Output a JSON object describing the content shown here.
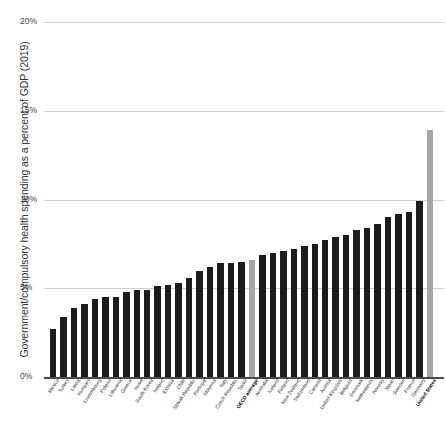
{
  "chart_data": {
    "type": "bar",
    "title": "",
    "xlabel": "",
    "ylabel": "Government/compulsory health spending as a percent of GDP (2019)",
    "ylim": [
      0,
      20
    ],
    "ytick_labels": [
      "0%",
      "5%",
      "10%",
      "15%",
      "20%"
    ],
    "ytick_values": [
      0,
      5,
      10,
      15,
      20
    ],
    "grid": true,
    "legend": "none",
    "categories": [
      "Mexico",
      "Turkey",
      "Latvia",
      "Hungary",
      "Luxembourg",
      "Poland",
      "Lithuania",
      "Greece",
      "Israel",
      "South Korea",
      "Ireland",
      "Estonia",
      "Chile",
      "Slovak Republic",
      "Portugal",
      "Slovenia",
      "Italy",
      "Czech Republic",
      "Spain",
      "OECD average",
      "Australia",
      "Iceland",
      "Finland",
      "New Zealand",
      "Switzerland",
      "Canada",
      "Austria",
      "United Kingdom",
      "Belgium",
      "Denmark",
      "Netherlands",
      "Norway",
      "Japan",
      "Sweden",
      "France",
      "Germany",
      "United States"
    ],
    "values": [
      2.7,
      3.4,
      3.9,
      4.1,
      4.4,
      4.5,
      4.5,
      4.8,
      4.9,
      4.9,
      5.1,
      5.2,
      5.3,
      5.6,
      6.0,
      6.2,
      6.4,
      6.4,
      6.5,
      6.6,
      6.9,
      7.0,
      7.1,
      7.2,
      7.4,
      7.5,
      7.7,
      7.9,
      8.0,
      8.3,
      8.4,
      8.6,
      9.0,
      9.2,
      9.3,
      9.9,
      13.9
    ],
    "highlighted_categories": [
      "OECD average",
      "United States"
    ],
    "bold_labels": [
      "OECD average",
      "United States"
    ],
    "colors": {
      "bar": "#1c1c1c",
      "highlight_bar": "#a6a6a6",
      "gridline": "#d0d0d0",
      "axis": "#4a4a4a",
      "text": "#333333"
    }
  }
}
